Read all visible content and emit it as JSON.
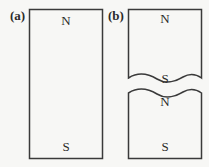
{
  "panels": [
    {
      "label": "(a)",
      "description": "whole bar magnet",
      "top_pole": "N",
      "bottom_pole": "S"
    },
    {
      "label": "(b)",
      "description": "bar magnet broken into two pieces",
      "upper_piece": {
        "top_pole": "N",
        "bottom_pole": "S"
      },
      "lower_piece": {
        "top_pole": "N",
        "bottom_pole": "S"
      }
    }
  ],
  "colors": {
    "line": "#3a3a3a",
    "background": "#f7f7f5"
  }
}
